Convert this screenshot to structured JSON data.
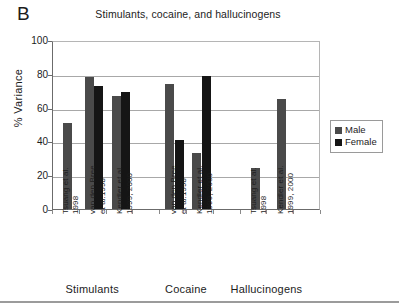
{
  "panel": {
    "letter": "B"
  },
  "legend": {
    "position": "right",
    "items": [
      {
        "label": "Male",
        "color": "#4a4a4a",
        "key": "male"
      },
      {
        "label": "Female",
        "color": "#151515",
        "key": "female"
      }
    ]
  },
  "axis": {
    "y_title": "% Variance",
    "y_ticks": [
      "100",
      "80",
      "60",
      "40",
      "20",
      "0"
    ]
  },
  "groups": [
    {
      "label": "Stimulants"
    },
    {
      "label": "Cocaine"
    },
    {
      "label": "Hallucinogens"
    }
  ],
  "studies": [
    {
      "line1": "Tsuang et al.",
      "line2": "1998"
    },
    {
      "line1": "van den Bree",
      "line2": "et al.1998"
    },
    {
      "line1": "Kendler et al.",
      "line2": "1999, 2000"
    },
    {
      "line1": "van den Bree",
      "line2": "et al.1998"
    },
    {
      "line1": "Kendler et al.",
      "line2": "1999, 2000"
    },
    {
      "line1": "Tsuang et al.",
      "line2": "1998"
    },
    {
      "line1": "Kendler et al.",
      "line2": "1999, 2000"
    }
  ],
  "chart_data": {
    "type": "bar",
    "title": "Stimulants, cocaine, and hallucinogens",
    "xlabel": "",
    "ylabel": "% Variance",
    "ylim": [
      0,
      100
    ],
    "yticks": [
      0,
      20,
      40,
      60,
      80,
      100
    ],
    "grid": true,
    "legend_position": "right",
    "categories": [
      "Stimulants - Tsuang et al. 1998",
      "Stimulants - van den Bree et al.1998",
      "Stimulants - Kendler et al. 1999, 2000",
      "Cocaine - van den Bree et al.1998",
      "Cocaine - Kendler et al. 1999, 2000",
      "Hallucinogens - Tsuang et al. 1998",
      "Hallucinogens - Kendler et al. 1999, 2000"
    ],
    "series": [
      {
        "name": "Male",
        "color": "#4a4a4a",
        "values": [
          51,
          78,
          67,
          74,
          33,
          24,
          65
        ]
      },
      {
        "name": "Female",
        "color": "#151515",
        "values": [
          null,
          73,
          69,
          41,
          79,
          null,
          null
        ]
      }
    ]
  }
}
